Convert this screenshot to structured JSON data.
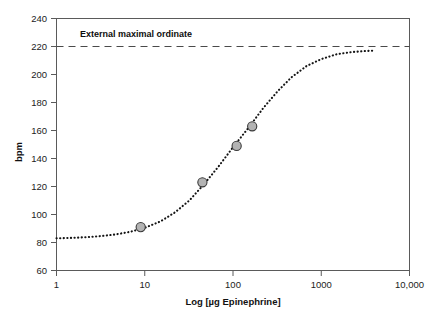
{
  "chart_data": {
    "type": "line",
    "title": "",
    "subtitle": "",
    "xlabel": "Log [µg Epinephrine]",
    "ylabel": "bpm",
    "xscale": "log",
    "xlim": [
      1,
      10000
    ],
    "ylim": [
      60,
      240
    ],
    "grid": false,
    "legend": "none",
    "x_ticks": [
      {
        "value": 1,
        "label": "1"
      },
      {
        "value": 10,
        "label": "10"
      },
      {
        "value": 100,
        "label": "100"
      },
      {
        "value": 1000,
        "label": "1000"
      },
      {
        "value": 10000,
        "label": "10,000"
      }
    ],
    "y_ticks": [
      {
        "value": 60,
        "label": "60"
      },
      {
        "value": 80,
        "label": "80"
      },
      {
        "value": 100,
        "label": "100"
      },
      {
        "value": 120,
        "label": "120"
      },
      {
        "value": 140,
        "label": "140"
      },
      {
        "value": 160,
        "label": "160"
      },
      {
        "value": 180,
        "label": "180"
      },
      {
        "value": 200,
        "label": "200"
      },
      {
        "value": 220,
        "label": "220"
      },
      {
        "value": 240,
        "label": "240"
      }
    ],
    "series": [
      {
        "name": "Fitted dose-response curve",
        "style": "dotted",
        "color": "#141414",
        "x": [
          1,
          1.5,
          2.2,
          3.2,
          4.6,
          6.8,
          10,
          15,
          22,
          32,
          46,
          68,
          100,
          150,
          220,
          320,
          460,
          680,
          1000,
          1500,
          2200,
          3200,
          4000
        ],
        "y": [
          83,
          83.3,
          83.8,
          84.6,
          85.7,
          87.6,
          90.5,
          95,
          101.5,
          110,
          121,
          134,
          148,
          162,
          176,
          188,
          198,
          206,
          211,
          214.5,
          216,
          216.8,
          217
        ]
      },
      {
        "name": "Observed data points",
        "style": "markers",
        "marker_fill": "#b3b3b3",
        "marker_edge": "#3a3a3a",
        "points": [
          {
            "x": 9,
            "y": 91
          },
          {
            "x": 45,
            "y": 123
          },
          {
            "x": 110,
            "y": 149
          },
          {
            "x": 165,
            "y": 163
          }
        ]
      }
    ],
    "annotations": [
      {
        "name": "external-maximal-ordinate",
        "text": "External maximal ordinate",
        "type": "horizontal-dashed-line-with-label",
        "y_value": 220,
        "label_x_value": 6,
        "line_color": "#4a4a4a"
      }
    ]
  }
}
